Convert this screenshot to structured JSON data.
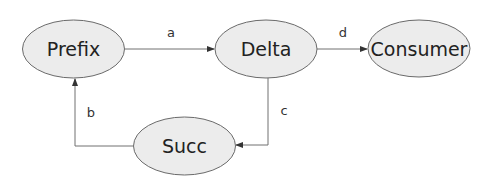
{
  "diagram": {
    "type": "flow",
    "nodes": [
      {
        "id": "prefix",
        "label": "Prefix"
      },
      {
        "id": "delta",
        "label": "Delta"
      },
      {
        "id": "consumer",
        "label": "Consumer"
      },
      {
        "id": "succ",
        "label": "Succ"
      }
    ],
    "edges": [
      {
        "id": "a",
        "from": "prefix",
        "to": "delta",
        "label": "a"
      },
      {
        "id": "d",
        "from": "delta",
        "to": "consumer",
        "label": "d"
      },
      {
        "id": "c",
        "from": "delta",
        "to": "succ",
        "label": "c"
      },
      {
        "id": "b",
        "from": "succ",
        "to": "prefix",
        "label": "b"
      }
    ],
    "colors": {
      "node_fill": "#ececec",
      "node_stroke": "#6a6a6a",
      "edge": "#707070"
    }
  }
}
